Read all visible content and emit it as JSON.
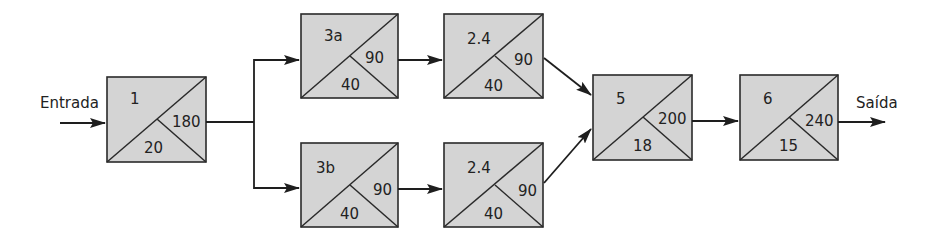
{
  "diagram": {
    "input_label": "Entrada",
    "output_label": "Saída",
    "colors": {
      "box_fill": "#d4d4d4",
      "stroke": "#2a2a2a"
    },
    "nodes": [
      {
        "id": "n1",
        "name": "1",
        "right": "180",
        "bottom": "20",
        "x": 107,
        "y": 77,
        "w": 99,
        "h": 85
      },
      {
        "id": "n3a",
        "name": "3a",
        "right": "90",
        "bottom": "40",
        "x": 301,
        "y": 14,
        "w": 97,
        "h": 84
      },
      {
        "id": "n3b",
        "name": "3b",
        "right": "90",
        "bottom": "40",
        "x": 301,
        "y": 143,
        "w": 97,
        "h": 84
      },
      {
        "id": "n24a",
        "name": "2.4",
        "right": "90",
        "bottom": "40",
        "x": 444,
        "y": 14,
        "w": 99,
        "h": 84
      },
      {
        "id": "n24b",
        "name": "2.4",
        "right": "90",
        "bottom": "40",
        "x": 444,
        "y": 143,
        "w": 99,
        "h": 84
      },
      {
        "id": "n5",
        "name": "5",
        "right": "200",
        "bottom": "18",
        "x": 593,
        "y": 75,
        "w": 99,
        "h": 85
      },
      {
        "id": "n6",
        "name": "6",
        "right": "240",
        "bottom": "15",
        "x": 740,
        "y": 75,
        "w": 98,
        "h": 85
      }
    ],
    "edges": [
      {
        "from": "Entrada",
        "to": "1"
      },
      {
        "from": "1",
        "to": "3a"
      },
      {
        "from": "1",
        "to": "3b"
      },
      {
        "from": "3a",
        "to": "2.4 (top)"
      },
      {
        "from": "3b",
        "to": "2.4 (bottom)"
      },
      {
        "from": "2.4 (top)",
        "to": "5"
      },
      {
        "from": "2.4 (bottom)",
        "to": "5"
      },
      {
        "from": "5",
        "to": "6"
      },
      {
        "from": "6",
        "to": "Saída"
      }
    ]
  }
}
